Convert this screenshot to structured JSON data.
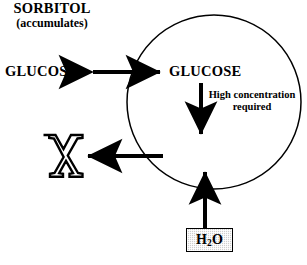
{
  "diagram": {
    "background_color": "#ffffff",
    "stroke_color": "#000000",
    "cell": {
      "name": "cell-membrane-circle",
      "shape": "circle",
      "center_x": 214,
      "center_y": 102,
      "radius": 87
    },
    "nodes": {
      "glucose_external": {
        "label": "GLUCOSE",
        "location": "outside-cell"
      },
      "glucose_internal": {
        "label": "GLUCOSE",
        "location": "inside-cell"
      },
      "sorbitol": {
        "label": "SORBITOL",
        "sublabel": "(accumulates)",
        "location": "inside-cell"
      },
      "water": {
        "label_html": "H<sub>2</sub>O",
        "label_text": "H2O",
        "fill_color": "#cfcfcf",
        "border_color": "#000000",
        "location": "outside-cell"
      },
      "blocked": {
        "symbol": "X",
        "meaning": "efflux-blocked"
      }
    },
    "edges": {
      "glucose_transport": {
        "label": "",
        "style": "double-headed-arrow",
        "direction": "bidirectional",
        "from": "glucose-external",
        "to": "glucose-internal"
      },
      "aldose_reductase": {
        "label_line1": "High concentration",
        "label_line2": "required",
        "style": "arrow",
        "direction": "down",
        "from": "glucose-internal",
        "to": "sorbitol"
      },
      "sorbitol_efflux": {
        "label": "",
        "style": "arrow",
        "direction": "left",
        "from": "sorbitol",
        "to": "blocked-x"
      },
      "water_influx": {
        "label": "",
        "style": "arrow",
        "direction": "up",
        "from": "water",
        "to": "sorbitol"
      }
    }
  }
}
